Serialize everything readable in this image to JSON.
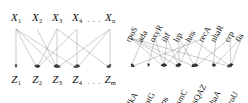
{
  "figure": {
    "title": "",
    "panels": [
      {
        "id": "generic-bipartite",
        "name": "generic bipartite graph",
        "top_nodes": [
          {
            "id": "x1",
            "label": "X",
            "sub": "1",
            "x": 16
          },
          {
            "id": "x2",
            "label": "X",
            "sub": "2",
            "x": 37
          },
          {
            "id": "x3",
            "label": "X",
            "sub": "3",
            "x": 57
          },
          {
            "id": "x4",
            "label": "X",
            "sub": "4",
            "x": 77
          },
          {
            "id": "xn",
            "label": "X",
            "sub": "n",
            "x": 110
          }
        ],
        "top_ellipsis": {
          "text": "· · ·",
          "x": 94
        },
        "bottom_nodes": [
          {
            "id": "z1",
            "label": "Z",
            "sub": "1",
            "x": 16
          },
          {
            "id": "z2",
            "label": "Z",
            "sub": "2",
            "x": 37
          },
          {
            "id": "z3",
            "label": "Z",
            "sub": "3",
            "x": 57
          },
          {
            "id": "z4",
            "label": "Z",
            "sub": "4",
            "x": 77
          },
          {
            "id": "zm",
            "label": "Z",
            "sub": "m",
            "x": 110
          }
        ],
        "bottom_ellipsis": {
          "text": "· · ·",
          "x": 94
        },
        "edges": [
          {
            "from": "x1",
            "to": "z1"
          },
          {
            "from": "x1",
            "to": "z2"
          },
          {
            "from": "x1",
            "to": "z3"
          },
          {
            "from": "x1",
            "to": "z4"
          },
          {
            "from": "x2",
            "to": "z3"
          },
          {
            "from": "x3",
            "to": "z2"
          },
          {
            "from": "x3",
            "to": "z3"
          },
          {
            "from": "x3",
            "to": "zm"
          },
          {
            "from": "x4",
            "to": "z2"
          },
          {
            "from": "x4",
            "to": "z4"
          },
          {
            "from": "xn",
            "to": "z3"
          },
          {
            "from": "xn",
            "to": "z4"
          },
          {
            "from": "xn",
            "to": "zm"
          }
        ]
      },
      {
        "id": "ecoli-network",
        "name": "E. coli transcription network",
        "top_nodes": [
          {
            "id": "rpoS",
            "label": "rpoS",
            "x": 7
          },
          {
            "id": "ada",
            "label": "ada",
            "x": 19
          },
          {
            "id": "oxyR",
            "label": "oxyR",
            "x": 31
          },
          {
            "id": "ihf",
            "label": "ihf",
            "x": 43
          },
          {
            "id": "lrp",
            "label": "lrp",
            "x": 55
          },
          {
            "id": "hns",
            "label": "hns",
            "x": 67
          },
          {
            "id": "recA",
            "label": "recA",
            "x": 80
          },
          {
            "id": "nhaR",
            "label": "nhaR",
            "x": 92
          },
          {
            "id": "crp",
            "label": "crp",
            "x": 106
          },
          {
            "id": "fis",
            "label": "fis",
            "x": 117
          }
        ],
        "bottom_nodes": [
          {
            "id": "alkA",
            "label": "alkA",
            "x": 7
          },
          {
            "id": "katG",
            "label": "katG",
            "x": 24
          },
          {
            "id": "dps",
            "label": "dps",
            "x": 40
          },
          {
            "id": "osmC",
            "label": "osmC",
            "x": 55
          },
          {
            "id": "ftsQAZ",
            "label": "ftsQAZ",
            "x": 71
          },
          {
            "id": "nhaA",
            "label": "nhaA",
            "x": 89
          },
          {
            "id": "proU",
            "label": "proU",
            "x": 107
          }
        ],
        "edges": [
          {
            "from": "rpoS",
            "to": "dps"
          },
          {
            "from": "rpoS",
            "to": "osmC"
          },
          {
            "from": "rpoS",
            "to": "ftsQAZ"
          },
          {
            "from": "rpoS",
            "to": "proU"
          },
          {
            "from": "ada",
            "to": "alkA"
          },
          {
            "from": "oxyR",
            "to": "katG"
          },
          {
            "from": "oxyR",
            "to": "dps"
          },
          {
            "from": "ihf",
            "to": "dps"
          },
          {
            "from": "ihf",
            "to": "osmC"
          },
          {
            "from": "lrp",
            "to": "osmC"
          },
          {
            "from": "lrp",
            "to": "ftsQAZ"
          },
          {
            "from": "hns",
            "to": "dps"
          },
          {
            "from": "hns",
            "to": "osmC"
          },
          {
            "from": "hns",
            "to": "proU"
          },
          {
            "from": "recA",
            "to": "alkA"
          },
          {
            "from": "recA",
            "to": "ftsQAZ"
          },
          {
            "from": "nhaR",
            "to": "nhaA"
          },
          {
            "from": "crp",
            "to": "ftsQAZ"
          },
          {
            "from": "crp",
            "to": "proU"
          },
          {
            "from": "fis",
            "to": "nhaA"
          },
          {
            "from": "fis",
            "to": "proU"
          }
        ]
      }
    ],
    "style": {
      "edge_color": "#9a9a9a",
      "arrow_color": "#2b2b2b",
      "text_color": "#111111",
      "background": "#ffffff"
    }
  }
}
